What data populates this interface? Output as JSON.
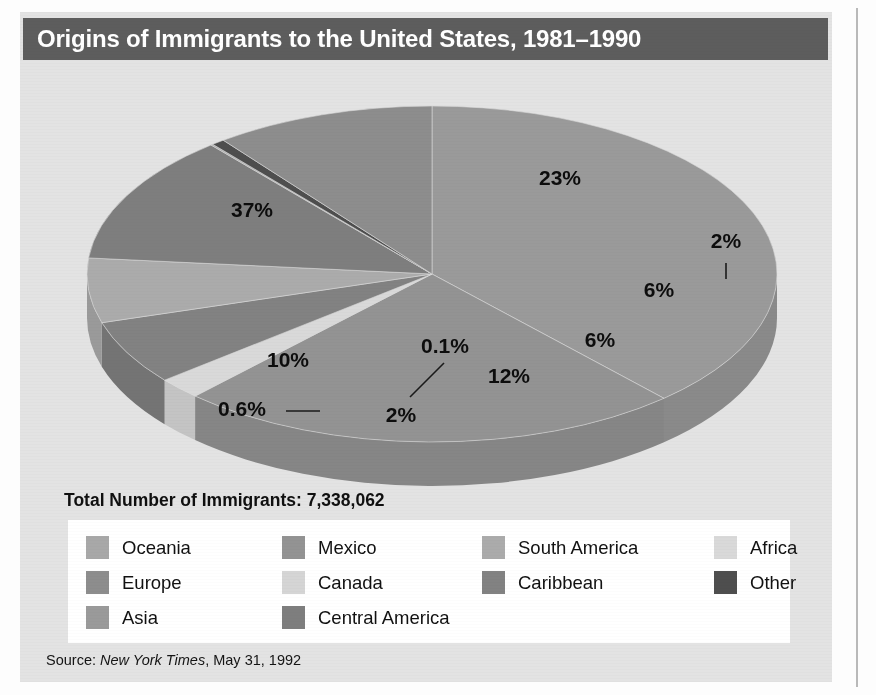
{
  "figure": {
    "title": "Origins of Immigrants to the United States, 1981–1990",
    "total_line": "Total Number of Immigrants: 7,338,062",
    "source_prefix": "Source: ",
    "source_publication": "New York Times",
    "source_date": ", May 31, 1992",
    "banner_color": "#5d5d5d",
    "panel_color": "#e3e3e3",
    "legend_bg": "#ffffff"
  },
  "legend": {
    "items": [
      {
        "label": "Oceania",
        "color": "#a8a8a8",
        "col": 1,
        "row": 1
      },
      {
        "label": "Europe",
        "color": "#8d8d8d",
        "col": 1,
        "row": 2
      },
      {
        "label": "Asia",
        "color": "#9a9a9a",
        "col": 1,
        "row": 3
      },
      {
        "label": "Mexico",
        "color": "#939393",
        "col": 2,
        "row": 1
      },
      {
        "label": "Canada",
        "color": "#d5d5d5",
        "col": 2,
        "row": 2
      },
      {
        "label": "Central America",
        "color": "#7e7e7e",
        "col": 2,
        "row": 3
      },
      {
        "label": "South America",
        "color": "#ababab",
        "col": 3,
        "row": 1
      },
      {
        "label": "Caribbean",
        "color": "#828282",
        "col": 3,
        "row": 2
      },
      {
        "label": "Africa",
        "color": "#d9d9d9",
        "col": 4,
        "row": 1
      },
      {
        "label": "Other",
        "color": "#4e4e4e",
        "col": 4,
        "row": 2
      }
    ]
  },
  "chart_data": {
    "type": "pie",
    "title": "Origins of Immigrants to the United States, 1981–1990",
    "subtitle": "Total Number of Immigrants: 7,338,062",
    "total": 7338062,
    "total_label": "Total Number of Immigrants: 7,338,062",
    "value_unit": "percent",
    "three_d": true,
    "legend_position": "bottom",
    "grid": false,
    "categories": [
      "Asia",
      "Mexico",
      "Africa",
      "Caribbean",
      "South America",
      "Central America",
      "Oceania",
      "Other",
      "Europe"
    ],
    "values": [
      37,
      23,
      2,
      6,
      6,
      12,
      0.1,
      0.6,
      10
    ],
    "labels": [
      "37%",
      "23%",
      "2%",
      "6%",
      "6%",
      "12%",
      "0.1%",
      "0.6%",
      "10%"
    ],
    "slices": [
      {
        "name": "Asia",
        "value": 37,
        "label": "37%",
        "color": "#9a9a9a",
        "side_color": "#8a8a8a",
        "leader": false
      },
      {
        "name": "Mexico",
        "value": 23,
        "label": "23%",
        "color": "#939393",
        "side_color": "#868686",
        "leader": false
      },
      {
        "name": "Africa",
        "value": 2,
        "label": "2%",
        "color": "#d9d9d9",
        "side_color": "#c4c4c4",
        "leader": true
      },
      {
        "name": "Caribbean",
        "value": 6,
        "label": "6%",
        "color": "#828282",
        "side_color": "#747474",
        "leader": false
      },
      {
        "name": "South America",
        "value": 6,
        "label": "6%",
        "color": "#ababab",
        "side_color": "#9a9a9a",
        "leader": false
      },
      {
        "name": "Central America",
        "value": 12,
        "label": "12%",
        "color": "#7e7e7e",
        "side_color": "#727272",
        "leader": false
      },
      {
        "name": "Oceania",
        "value": 0.1,
        "label": "0.1%",
        "color": "#a8a8a8",
        "side_color": "#979797",
        "leader": true
      },
      {
        "name": "Other",
        "value": 0.6,
        "label": "0.6%",
        "color": "#4e4e4e",
        "side_color": "#444444",
        "leader": true
      },
      {
        "name": "Europe",
        "value": 10,
        "label": "10%",
        "color": "#8d8d8d",
        "side_color": "#7f7f7f",
        "leader": false
      }
    ],
    "annotations": [
      {
        "text": "37%",
        "x": 232,
        "y": 150
      },
      {
        "text": "23%",
        "x": 540,
        "y": 118
      },
      {
        "text": "2%",
        "x": 706,
        "y": 181
      },
      {
        "text": "6%",
        "x": 639,
        "y": 230
      },
      {
        "text": "6%",
        "x": 580,
        "y": 280
      },
      {
        "text": "12%",
        "x": 489,
        "y": 316
      },
      {
        "text": "0.1%",
        "x": 425,
        "y": 286
      },
      {
        "text": "10%",
        "x": 268,
        "y": 300
      },
      {
        "text": "0.6%",
        "x": 222,
        "y": 349
      },
      {
        "text": "2%",
        "x": 381,
        "y": 355
      }
    ]
  }
}
